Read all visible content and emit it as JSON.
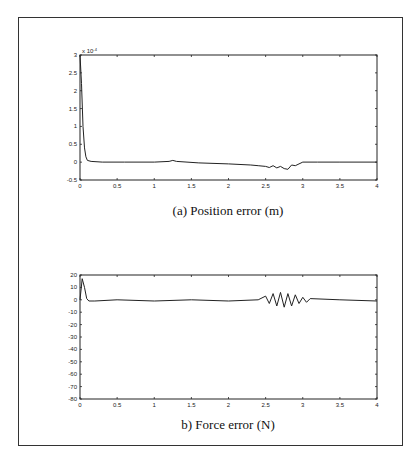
{
  "chart_data": [
    {
      "type": "line",
      "title": "",
      "caption": "(a) Position error (m)",
      "xlabel": "",
      "ylabel": "",
      "y_scale_label": "x 10^-4",
      "xlim": [
        0,
        4
      ],
      "ylim": [
        -0.5,
        3
      ],
      "grid": false,
      "x_ticks": [
        "0",
        "0.5",
        "1",
        "1.5",
        "2",
        "2.5",
        "3",
        "3.5",
        "4"
      ],
      "y_ticks": [
        "3",
        "2.5",
        "2",
        "1.5",
        "1",
        "0.5",
        "0",
        "-0.5"
      ],
      "series": [
        {
          "name": "position error",
          "x": [
            0,
            0.02,
            0.04,
            0.06,
            0.08,
            0.1,
            0.15,
            0.3,
            0.6,
            1.0,
            1.2,
            1.25,
            1.3,
            1.6,
            2.0,
            2.3,
            2.4,
            2.5,
            2.55,
            2.6,
            2.65,
            2.7,
            2.75,
            2.8,
            2.85,
            2.9,
            2.95,
            3.0,
            3.2,
            3.5,
            4.0
          ],
          "values": [
            3.0,
            2.2,
            1.0,
            0.4,
            0.15,
            0.05,
            0.02,
            0.0,
            0.0,
            0.0,
            0.02,
            0.05,
            0.02,
            -0.02,
            -0.05,
            -0.08,
            -0.1,
            -0.12,
            -0.15,
            -0.1,
            -0.16,
            -0.12,
            -0.18,
            -0.2,
            -0.08,
            -0.1,
            -0.05,
            0.0,
            0.0,
            0.0,
            0.0
          ]
        }
      ]
    },
    {
      "type": "line",
      "title": "",
      "caption": "b) Force error (N)",
      "xlabel": "",
      "ylabel": "",
      "xlim": [
        0,
        4
      ],
      "ylim": [
        -80,
        20
      ],
      "grid": false,
      "x_ticks": [
        "0",
        "0.5",
        "1",
        "1.5",
        "2",
        "2.5",
        "3",
        "3.5",
        "4"
      ],
      "y_ticks": [
        "20",
        "10",
        "0",
        "-10",
        "-20",
        "-30",
        "-40",
        "-50",
        "-60",
        "-70",
        "-80"
      ],
      "series": [
        {
          "name": "force error",
          "x": [
            0,
            0.03,
            0.06,
            0.09,
            0.12,
            0.2,
            0.5,
            1.0,
            1.5,
            2.0,
            2.4,
            2.5,
            2.55,
            2.6,
            2.65,
            2.7,
            2.75,
            2.8,
            2.85,
            2.9,
            2.95,
            3.0,
            3.05,
            3.1,
            3.5,
            4.0
          ],
          "values": [
            0,
            17,
            10,
            1,
            -1,
            -1,
            0,
            -1,
            0,
            -1,
            0,
            3,
            -3,
            5,
            -5,
            6,
            -6,
            5,
            -5,
            4,
            -3,
            2,
            -2,
            1,
            0,
            -1
          ]
        }
      ]
    }
  ],
  "captions": {
    "top": "(a) Position error (m)",
    "bottom": "b) Force error (N)"
  },
  "top_axis": {
    "scale_label": "x 10",
    "scale_exp": "-4",
    "x_ticks": [
      "0",
      "0.5",
      "1",
      "1.5",
      "2",
      "2.5",
      "3",
      "3.5",
      "4"
    ],
    "y_ticks": [
      "3",
      "2.5",
      "2",
      "1.5",
      "1",
      "0.5",
      "0",
      "-0.5"
    ]
  },
  "bottom_axis": {
    "x_ticks": [
      "0",
      "0.5",
      "1",
      "1.5",
      "2",
      "2.5",
      "3",
      "3.5",
      "4"
    ],
    "y_ticks": [
      "20",
      "10",
      "0",
      "-10",
      "-20",
      "-30",
      "-40",
      "-50",
      "-60",
      "-70",
      "-80"
    ]
  }
}
